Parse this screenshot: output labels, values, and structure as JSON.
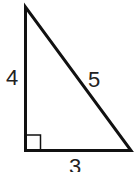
{
  "figure": {
    "type": "right-triangle",
    "stroke_color": "#111111",
    "label_color": "#333333",
    "background": "#ffffff",
    "vertices": {
      "top": [
        25.5,
        7
      ],
      "right_angle": [
        25.5,
        150.5
      ],
      "right": [
        131,
        150.5
      ]
    },
    "right_angle_marker": {
      "size": 15
    },
    "labels": {
      "left_leg": "4",
      "hypotenuse": "5",
      "bottom_leg": "3"
    }
  }
}
